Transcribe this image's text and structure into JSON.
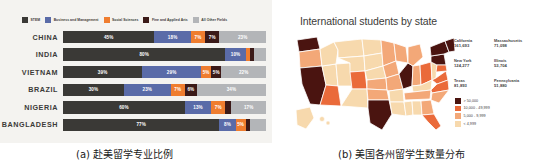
{
  "panel_a": {
    "background": "#f4f3f0",
    "legend": [
      {
        "label": "STEM",
        "color": "#3a3936"
      },
      {
        "label": "Business and Management",
        "color": "#5a6ba8"
      },
      {
        "label": "Social Sciences",
        "color": "#ef7d2f"
      },
      {
        "label": "Fine and Applied Arts",
        "color": "#3b1a18"
      },
      {
        "label": "All Other Fields",
        "color": "#b3b5b8"
      }
    ],
    "rows": [
      {
        "country": "CHINA",
        "segments": [
          {
            "field": "STEM",
            "value": 45,
            "label": "45%",
            "color": "#3a3936"
          },
          {
            "field": "Business and Management",
            "value": 18,
            "label": "18%",
            "color": "#5a6ba8"
          },
          {
            "field": "Social Sciences",
            "value": 7,
            "label": "7%",
            "color": "#ef7d2f"
          },
          {
            "field": "Fine and Applied Arts",
            "value": 7,
            "label": "7%",
            "color": "#3b1a18"
          },
          {
            "field": "All Other Fields",
            "value": 23,
            "label": "23%",
            "color": "#b3b5b8"
          }
        ]
      },
      {
        "country": "INDIA",
        "segments": [
          {
            "field": "STEM",
            "value": 80,
            "label": "80%",
            "color": "#3a3936"
          },
          {
            "field": "Business and Management",
            "value": 10,
            "label": "10%",
            "color": "#5a6ba8"
          },
          {
            "field": "Social Sciences",
            "value": 2,
            "label": "",
            "color": "#ef7d2f"
          },
          {
            "field": "Fine and Applied Arts",
            "value": 2,
            "label": "",
            "color": "#3b1a18"
          },
          {
            "field": "All Other Fields",
            "value": 6,
            "label": "",
            "color": "#b3b5b8"
          }
        ]
      },
      {
        "country": "VIETNAM",
        "segments": [
          {
            "field": "STEM",
            "value": 39,
            "label": "39%",
            "color": "#3a3936"
          },
          {
            "field": "Business and Management",
            "value": 29,
            "label": "29%",
            "color": "#5a6ba8"
          },
          {
            "field": "Social Sciences",
            "value": 5,
            "label": "5%",
            "color": "#ef7d2f"
          },
          {
            "field": "Fine and Applied Arts",
            "value": 5,
            "label": "5%",
            "color": "#3b1a18"
          },
          {
            "field": "All Other Fields",
            "value": 22,
            "label": "22%",
            "color": "#b3b5b8"
          }
        ]
      },
      {
        "country": "BRAZIL",
        "segments": [
          {
            "field": "STEM",
            "value": 30,
            "label": "30%",
            "color": "#3a3936"
          },
          {
            "field": "Business and Management",
            "value": 23,
            "label": "23%",
            "color": "#5a6ba8"
          },
          {
            "field": "Social Sciences",
            "value": 7,
            "label": "7%",
            "color": "#ef7d2f"
          },
          {
            "field": "Fine and Applied Arts",
            "value": 6,
            "label": "6%",
            "color": "#3b1a18"
          },
          {
            "field": "All Other Fields",
            "value": 34,
            "label": "34%",
            "color": "#b3b5b8"
          }
        ]
      },
      {
        "country": "NIGERIA",
        "segments": [
          {
            "field": "STEM",
            "value": 60,
            "label": "60%",
            "color": "#3a3936"
          },
          {
            "field": "Business and Management",
            "value": 13,
            "label": "13%",
            "color": "#5a6ba8"
          },
          {
            "field": "Social Sciences",
            "value": 7,
            "label": "7%",
            "color": "#ef7d2f"
          },
          {
            "field": "Fine and Applied Arts",
            "value": 3,
            "label": "",
            "color": "#3b1a18"
          },
          {
            "field": "All Other Fields",
            "value": 17,
            "label": "17%",
            "color": "#b3b5b8"
          }
        ]
      },
      {
        "country": "BANGLADESH",
        "segments": [
          {
            "field": "STEM",
            "value": 77,
            "label": "77%",
            "color": "#3a3936"
          },
          {
            "field": "Business and Management",
            "value": 8,
            "label": "8%",
            "color": "#5a6ba8"
          },
          {
            "field": "Social Sciences",
            "value": 5,
            "label": "5%",
            "color": "#ef7d2f"
          },
          {
            "field": "Fine and Applied Arts",
            "value": 2,
            "label": "",
            "color": "#3b1a18"
          },
          {
            "field": "All Other Fields",
            "value": 8,
            "label": "",
            "color": "#b3b5b8"
          }
        ]
      }
    ]
  },
  "panel_b": {
    "title": "International students by state",
    "stats": [
      {
        "name": "California",
        "value": "161,693"
      },
      {
        "name": "Massachusetts",
        "value": "71,098"
      },
      {
        "name": "New York",
        "value": "124,277"
      },
      {
        "name": "Illinois",
        "value": "53,704"
      },
      {
        "name": "Texas",
        "value": "81,893"
      },
      {
        "name": "Pennsylvania",
        "value": "51,880"
      }
    ],
    "legend": [
      {
        "label": "> 50,000",
        "color": "#4a1410"
      },
      {
        "label": "10,000 - 49,999",
        "color": "#ea6a3a"
      },
      {
        "label": "5,000 - 9,999",
        "color": "#f3a878"
      },
      {
        "label": "< 4,999",
        "color": "#f7d9ad"
      }
    ]
  },
  "captions": {
    "a": "(a) 赴美留学专业比例",
    "b": "(b) 美国各州留学生数量分布"
  },
  "chart_data": [
    {
      "type": "bar",
      "orientation": "horizontal-stacked",
      "title": "赴美留学专业比例",
      "xlabel": "",
      "ylabel": "",
      "xlim": [
        0,
        100
      ],
      "grid": false,
      "legend_position": "top",
      "categories": [
        "CHINA",
        "INDIA",
        "VIETNAM",
        "BRAZIL",
        "NIGERIA",
        "BANGLADESH"
      ],
      "series": [
        {
          "name": "STEM",
          "color": "#3a3936",
          "values": [
            45,
            80,
            39,
            30,
            60,
            77
          ]
        },
        {
          "name": "Business and Management",
          "color": "#5a6ba8",
          "values": [
            18,
            10,
            29,
            23,
            13,
            8
          ]
        },
        {
          "name": "Social Sciences",
          "color": "#ef7d2f",
          "values": [
            7,
            2,
            5,
            7,
            7,
            5
          ]
        },
        {
          "name": "Fine and Applied Arts",
          "color": "#3b1a18",
          "values": [
            7,
            2,
            5,
            6,
            3,
            2
          ]
        },
        {
          "name": "All Other Fields",
          "color": "#b3b5b8",
          "values": [
            23,
            6,
            22,
            34,
            17,
            8
          ]
        }
      ],
      "units": "percent"
    },
    {
      "type": "heatmap",
      "subtype": "choropleth-map",
      "title": "International students by state",
      "region": "United States",
      "legend_position": "right",
      "bins": [
        {
          "label": "> 50,000",
          "color": "#4a1410"
        },
        {
          "label": "10,000 - 49,999",
          "color": "#ea6a3a"
        },
        {
          "label": "5,000 - 9,999",
          "color": "#f3a878"
        },
        {
          "label": "< 4,999",
          "color": "#f7d9ad"
        }
      ],
      "categories": [
        "California",
        "New York",
        "Texas",
        "Massachusetts",
        "Illinois",
        "Pennsylvania"
      ],
      "values": [
        161693,
        124277,
        81893,
        71098,
        53704,
        51880
      ]
    }
  ]
}
